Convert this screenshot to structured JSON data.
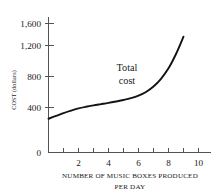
{
  "chart_data": {
    "type": "line",
    "title": "",
    "xlabel": "NUMBER OF MUSIC BOXES PRODUCED PER DAY",
    "xlabel_line1": "NUMBER OF MUSIC BOXES PRODUCED",
    "xlabel_line2": "PER DAY",
    "ylabel": "COST (dollars)",
    "xlim": [
      0,
      11
    ],
    "ylim": [
      0,
      1700
    ],
    "grid": false,
    "legend_position": "none",
    "x_ticks_major": [
      2,
      4,
      6,
      8,
      10
    ],
    "x_ticks_minor": [
      1,
      3,
      5,
      7,
      9
    ],
    "x_tick_labels": [
      "2",
      "4",
      "6",
      "8",
      "10"
    ],
    "y_ticks": [
      0,
      400,
      800,
      1200,
      1600
    ],
    "y_tick_labels": [
      "0",
      "400",
      "800",
      "1,200",
      "1,600"
    ],
    "series": [
      {
        "name": "Total cost",
        "x": [
          0,
          0.5,
          1,
          1.5,
          2,
          2.5,
          3,
          3.5,
          4,
          4.5,
          5,
          5.5,
          6,
          6.5,
          7,
          7.5,
          8,
          8.5,
          9
        ],
        "values": [
          300,
          325,
          350,
          372,
          392,
          410,
          428,
          444,
          460,
          478,
          497,
          520,
          552,
          600,
          670,
          770,
          905,
          1090,
          1360
        ]
      }
    ],
    "annotations": [
      {
        "name": "total-cost-label",
        "line1": "Total",
        "line2": "cost",
        "x": 6.0,
        "y": 1020
      }
    ],
    "colors": {
      "curve": "#15130f",
      "axis": "#55534f",
      "text": "#1a1a1a",
      "background": "#ffffff"
    }
  }
}
